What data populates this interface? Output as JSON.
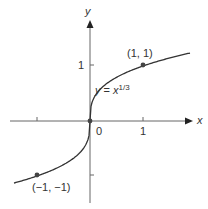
{
  "chart_data": {
    "type": "line",
    "title": "",
    "equation": {
      "lhs": "y",
      "eq": " = ",
      "base": "x",
      "exponent": "1/3"
    },
    "xlabel": "x",
    "ylabel": "y",
    "x_ticks": [
      -1,
      0,
      1
    ],
    "y_ticks": [
      -1,
      1
    ],
    "tick_labels": {
      "x_one": "1",
      "origin": "0",
      "y_one": "1"
    },
    "points": [
      {
        "x": 1,
        "y": 1,
        "label": "(1, 1)"
      },
      {
        "x": -1,
        "y": -1,
        "label": "(−1, −1)"
      },
      {
        "x": 0,
        "y": 0,
        "label": ""
      }
    ],
    "xlim": [
      -1.6,
      1.75
    ],
    "ylim": [
      -1.6,
      1.9
    ],
    "grid": false,
    "colors": {
      "curve": "#333333",
      "axes": "#555555",
      "points": "#444444"
    }
  }
}
